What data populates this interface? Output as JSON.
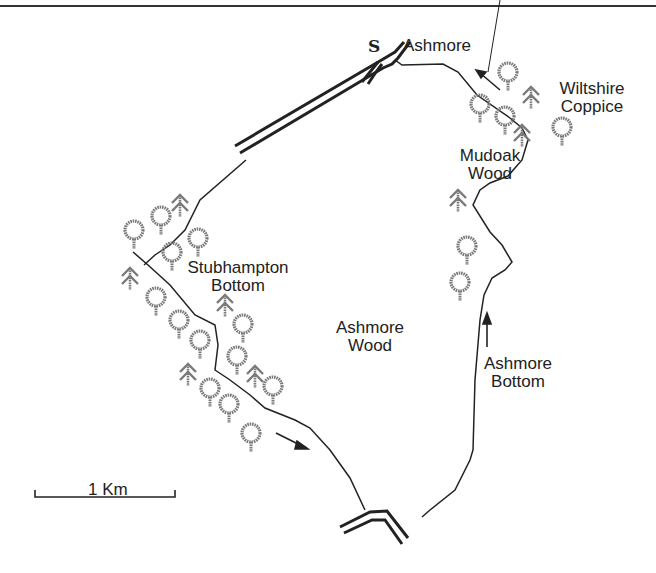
{
  "map": {
    "start_marker": "S",
    "labels": {
      "ashmore": "Ashmore",
      "wiltshire_coppice_1": "Wiltshire",
      "wiltshire_coppice_2": "Coppice",
      "mudoak_wood_1": "Mudoak",
      "mudoak_wood_2": "Wood",
      "stubhampton_bottom_1": "Stubhampton",
      "stubhampton_bottom_2": "Bottom",
      "ashmore_wood_1": "Ashmore",
      "ashmore_wood_2": "Wood",
      "ashmore_bottom_1": "Ashmore",
      "ashmore_bottom_2": "Bottom"
    },
    "scale_bar": {
      "label": "1 Km"
    },
    "symbols": {
      "deciduous_tree": "deciduous-tree-icon",
      "conifer_tree": "conifer-tree-icon",
      "direction_arrow": "arrow-icon"
    },
    "colors": {
      "line": "#222222",
      "tree": "#7a7a7a"
    }
  }
}
